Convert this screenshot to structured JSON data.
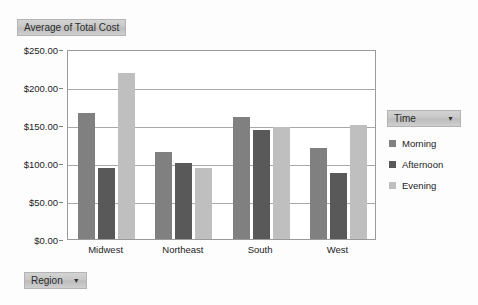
{
  "title": {
    "label": "Average of Total Cost"
  },
  "legend_field": {
    "label": "Time",
    "caret": "▼"
  },
  "region_field": {
    "label": "Region",
    "caret": "▼"
  },
  "chart_data": {
    "type": "bar",
    "title": "Average of Total Cost",
    "xlabel": "Region",
    "ylabel": "",
    "categories": [
      "Midwest",
      "Northeast",
      "South",
      "West"
    ],
    "series": [
      {
        "name": "Morning",
        "color": "#808080",
        "values": [
          166,
          114,
          160,
          120
        ]
      },
      {
        "name": "Afternoon",
        "color": "#595959",
        "values": [
          93,
          100,
          143,
          87
        ]
      },
      {
        "name": "Evening",
        "color": "#bfbfbf",
        "values": [
          219,
          93,
          148,
          150
        ]
      }
    ],
    "ylim": [
      0,
      250
    ],
    "yticks": [
      0,
      50,
      100,
      150,
      200,
      250
    ],
    "ytick_labels": [
      "$0.00",
      "$50.00",
      "$100.00",
      "$150.00",
      "$200.00",
      "$250.00"
    ],
    "grid": true,
    "legend_position": "right",
    "legend_title": "Time"
  }
}
